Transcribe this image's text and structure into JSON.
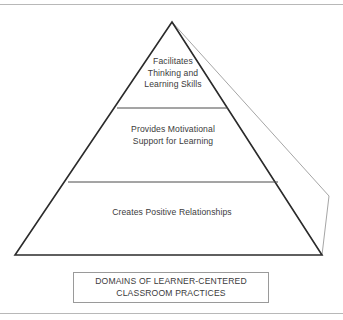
{
  "figure": {
    "name": "domains-of-learner-centered-classroom-practices-pyramid",
    "type": "pyramid-diagram",
    "colors": {
      "front_face_stroke": "#2b2b2b",
      "side_face_stroke": "#a6a6a6",
      "divider_stroke": "#4a4a4a",
      "text": "#3b3b3b",
      "caption_border": "#9a9a9a",
      "frame_rule": "#b8b8b8",
      "background": "#ffffff"
    }
  },
  "pyramid": {
    "tiers": [
      {
        "id": "top",
        "level": 1,
        "label": "Facilitates\nThinking and\nLearning Skills"
      },
      {
        "id": "middle",
        "level": 2,
        "label": "Provides Motivational\nSupport for Learning"
      },
      {
        "id": "bottom",
        "level": 3,
        "label": "Creates Positive Relationships"
      }
    ]
  },
  "caption": {
    "text": "DOMAINS OF LEARNER-CENTERED\nCLASSROOM PRACTICES"
  }
}
